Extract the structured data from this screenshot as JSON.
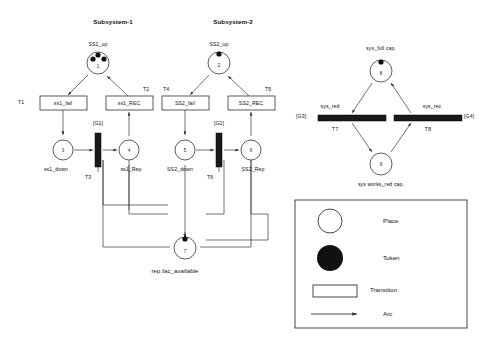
{
  "diagram": {
    "title_subsystem_1": "Subsystem-1",
    "title_subsystem_2": "Subsystem-2",
    "bottom_place_label": "rep.fac_available"
  },
  "subsystem1": {
    "header": "Subsystem-1",
    "place_up": {
      "id": "1",
      "label": "SS1_up",
      "tokens": 3
    },
    "place_down": {
      "id": "3",
      "label": "ss1_down",
      "tokens": 0
    },
    "place_rep": {
      "id": "4",
      "label": "ss1_Rep",
      "tokens": 0
    },
    "transition_fail": {
      "name": "T1",
      "label": "ss1_fail"
    },
    "transition_rec": {
      "name": "T2",
      "label": "ss1_REC"
    },
    "transition_bar": {
      "name": "T3",
      "guard": "[G1]"
    }
  },
  "subsystem2": {
    "header": "Subsystem-2",
    "place_up": {
      "id": "2",
      "label": "SS2_up",
      "tokens": 1
    },
    "place_down": {
      "id": "5",
      "label": "SS2_down",
      "tokens": 0
    },
    "place_rep": {
      "id": "6",
      "label": "SS2_Rep",
      "tokens": 0
    },
    "transition_fail": {
      "name": "T4",
      "label": "SS2_fail"
    },
    "transition_rec": {
      "name": "T5",
      "label": "SS2_REC"
    },
    "transition_bar": {
      "name": "T6",
      "guard": "[G2]"
    }
  },
  "shared": {
    "place_repair": {
      "id": "7",
      "label": "rep.fac_available",
      "tokens": 1
    }
  },
  "system": {
    "place_full": {
      "id": "8",
      "label": "sys_full cap.",
      "tokens": 1
    },
    "place_reduced": {
      "id": "9",
      "label": "sys works_red cap.",
      "tokens": 0
    },
    "transition_red": {
      "name": "T7",
      "label": "sys_red",
      "guard": "[G3]"
    },
    "transition_rec": {
      "name": "T8",
      "label": "sys_rec",
      "guard": "[G4]"
    }
  },
  "legend": {
    "place": "Place",
    "token": "Token",
    "transition": "Transition",
    "arc": "Arc"
  },
  "colors": {
    "stroke": "#333333",
    "token": "#111111",
    "bar": "#1a1a1a",
    "background": "#ffffff"
  }
}
